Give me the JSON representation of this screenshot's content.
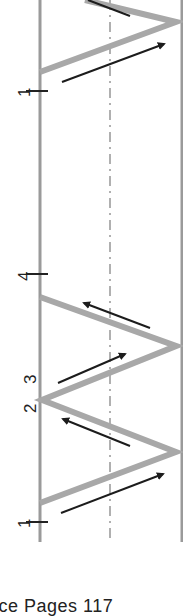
{
  "diagram": {
    "orientation": "rotated-90",
    "colors": {
      "boundary": "#9a9a9a",
      "path": "#a8a8a8",
      "arrow": "#1c1c1c",
      "centerline": "#b0b0b0",
      "text": "#222222"
    },
    "labels": [
      {
        "id": "point-1-top",
        "text": "1",
        "x": 28,
        "y": 91
      },
      {
        "id": "point-4",
        "text": "4",
        "x": 28,
        "y": 274
      },
      {
        "id": "point-3",
        "text": "3",
        "x": 28,
        "y": 378
      },
      {
        "id": "point-2",
        "text": "2",
        "x": 28,
        "y": 407
      },
      {
        "id": "point-1-bottom",
        "text": "1",
        "x": 28,
        "y": 522
      }
    ],
    "boundaries": {
      "left_x": 40,
      "right_x": 182,
      "center_x": 110,
      "top_y": 0,
      "bottom_y": 542
    }
  },
  "footer": {
    "text": "ice Pages  117"
  }
}
